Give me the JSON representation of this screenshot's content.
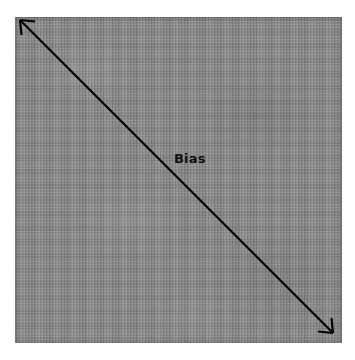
{
  "figure": {
    "title": "Bias",
    "background_color": "#ffffff",
    "fabric": {
      "name": "linen-fabric-swatch",
      "color": "#8a8a8a",
      "weave": "plain-weave"
    },
    "annotation": {
      "label": "Bias",
      "line_color": "#000000",
      "arrow_style": "double-headed",
      "direction": "top-left-to-bottom-right-diagonal",
      "start": {
        "x": 20,
        "y": 20
      },
      "end": {
        "x": 333,
        "y": 333
      }
    }
  }
}
